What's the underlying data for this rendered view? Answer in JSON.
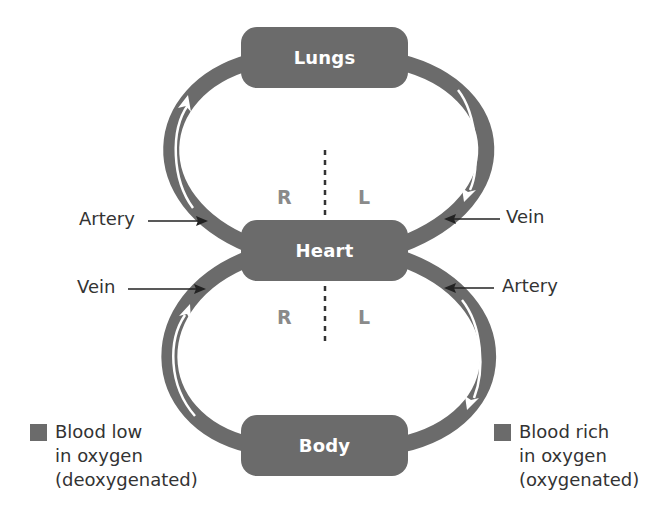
{
  "diagram": {
    "type": "double-circulation",
    "organs": {
      "lungs": "Lungs",
      "heart": "Heart",
      "body": "Body"
    },
    "sides": {
      "upper_right": "R",
      "upper_left": "L",
      "lower_right": "R",
      "lower_left": "L"
    },
    "vessels": {
      "upper_left": "Artery",
      "upper_right": "Vein",
      "lower_left": "Vein",
      "lower_right": "Artery"
    },
    "legend": [
      {
        "lines": [
          "Blood low",
          "in oxygen",
          "(deoxygenated)"
        ],
        "swatch_color": "#6b6b6b"
      },
      {
        "lines": [
          "Blood rich",
          "in oxygen",
          "(oxygenated)"
        ],
        "swatch_color": "#6b6b6b"
      }
    ],
    "colors": {
      "vessel": "#6b6b6b",
      "box": "#6b6b6b",
      "flow_arrow": "#ffffff",
      "side_label": "#8a8a8a",
      "text": "#333333"
    }
  }
}
